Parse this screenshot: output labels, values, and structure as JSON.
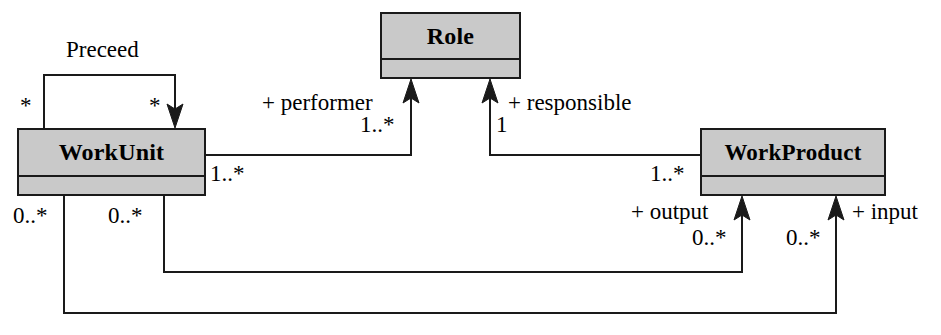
{
  "diagram": {
    "kind": "uml-class-diagram",
    "background_color": "#ffffff",
    "line_color": "#1a1a1a",
    "class_fill_color": "#c9c9c9",
    "classes": [
      {
        "id": "role",
        "name": "Role"
      },
      {
        "id": "workunit",
        "name": "WorkUnit"
      },
      {
        "id": "workproduct",
        "name": "WorkProduct"
      }
    ],
    "associations": [
      {
        "id": "preceed",
        "name": "Preceed",
        "source": "WorkUnit",
        "target": "WorkUnit",
        "source_multiplicity": "*",
        "target_multiplicity": "*"
      },
      {
        "id": "performer",
        "role": "+ performer",
        "source": "WorkUnit",
        "target": "Role",
        "target_multiplicity": "1..*"
      },
      {
        "id": "responsible",
        "role": "+ responsible",
        "source": "WorkProduct",
        "target": "Role",
        "target_multiplicity": "1"
      },
      {
        "id": "workunit-workproduct",
        "source": "WorkUnit",
        "target": "WorkProduct",
        "source_multiplicity": "1..*",
        "target_multiplicity": "1..*"
      },
      {
        "id": "output",
        "role": "+ output",
        "source": "WorkUnit",
        "target": "WorkProduct",
        "source_multiplicity": "0..*",
        "target_multiplicity": "0..*"
      },
      {
        "id": "input",
        "role": "+ input",
        "source": "WorkUnit",
        "target": "WorkProduct",
        "source_multiplicity": "0..*",
        "target_multiplicity": "0..*"
      }
    ],
    "labels": {
      "preceed": "Preceed",
      "preceed_source_star": "*",
      "preceed_target_star": "*",
      "performer": "+ performer",
      "performer_mult": "1..*",
      "responsible": "+ responsible",
      "responsible_mult": "1",
      "workunit_right_mult": "1..*",
      "workproduct_left_mult": "1..*",
      "workunit_out_mult": "0..*",
      "workunit_in_mult": "0..*",
      "output": "+ output",
      "output_mult": "0..*",
      "input": "+ input",
      "input_mult": "0..*"
    }
  }
}
